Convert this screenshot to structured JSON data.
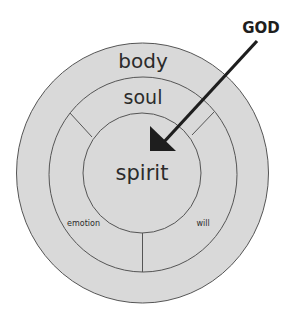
{
  "diagram": {
    "colors": {
      "fill": "#d9d9d9",
      "stroke": "#555555",
      "text": "#2b2b2b",
      "arrow": "#1e1e1e",
      "background": "#ffffff"
    },
    "layers": [
      {
        "name": "body",
        "label": "body"
      },
      {
        "name": "soul",
        "label": "soul"
      },
      {
        "name": "spirit",
        "label": "spirit"
      }
    ],
    "soul_parts": [
      {
        "name": "emotion",
        "label": "emotion"
      },
      {
        "name": "will",
        "label": "will"
      }
    ],
    "pointer": {
      "label": "GOD",
      "icon": "arrow-icon",
      "target": "spirit"
    }
  }
}
